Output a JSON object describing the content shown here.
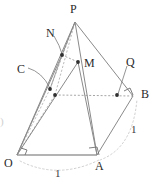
{
  "figure": {
    "kind": "geometry-diagram",
    "width": 159,
    "height": 186,
    "background": "#ffffff",
    "colors": {
      "solid_edge": "#8a8a8a",
      "dashed_edge": "#b0b0b0",
      "dotted_arc": "#c8c8c8",
      "base_edge": "#9a9a9a",
      "point_fill": "#303030",
      "label_text": "#2b2b2b",
      "leader_line": "#7a7a7a"
    },
    "vertices": [
      {
        "id": "P",
        "label": "P",
        "x": 75,
        "y": 22,
        "label_x": 70,
        "label_y": 3,
        "dot": false
      },
      {
        "id": "O",
        "label": "O",
        "x": 17,
        "y": 155,
        "label_x": 4,
        "label_y": 157,
        "dot": false
      },
      {
        "id": "A",
        "label": "A",
        "x": 97,
        "y": 155,
        "label_x": 95,
        "label_y": 160,
        "dot": false
      },
      {
        "id": "B",
        "label": "B",
        "x": 133,
        "y": 96,
        "label_x": 141,
        "label_y": 88,
        "dot": false
      },
      {
        "id": "C",
        "label": "C",
        "x": 50,
        "y": 89,
        "label_x": 17,
        "label_y": 63,
        "dot": true
      },
      {
        "id": "M",
        "label": "M",
        "x": 78,
        "y": 62,
        "label_x": 84,
        "label_y": 57,
        "dot": true
      },
      {
        "id": "N",
        "label": "N",
        "x": 62,
        "y": 55,
        "label_x": 46,
        "label_y": 27,
        "dot": true
      },
      {
        "id": "Q",
        "label": "Q",
        "x": 117,
        "y": 95,
        "label_x": 126,
        "label_y": 56,
        "dot": true
      }
    ],
    "extra_points": [
      {
        "id": "Cx",
        "x": 55,
        "y": 95,
        "dot": true
      }
    ],
    "solid_edges": [
      {
        "from": "O",
        "to": "A",
        "name": "edge-OA"
      },
      {
        "from": "O",
        "to": "P",
        "name": "edge-OP"
      },
      {
        "from": "A",
        "to": "P",
        "name": "edge-AP"
      },
      {
        "from": "P",
        "to": "B",
        "name": "edge-PB"
      },
      {
        "from": "A",
        "to": "B",
        "name": "edge-AB"
      },
      {
        "from": "O",
        "to": "N",
        "name": "edge-ON"
      },
      {
        "from": "N",
        "to": "P",
        "name": "edge-NP"
      },
      {
        "from": "O",
        "to": "M",
        "name": "edge-OM"
      },
      {
        "from": "M",
        "to": "A",
        "name": "edge-MA"
      }
    ],
    "dashed_edges": [
      {
        "from": "O",
        "to": "C",
        "name": "dashed-OC"
      },
      {
        "from": "C",
        "to": "P",
        "name": "dashed-CP"
      },
      {
        "from": "N",
        "to": "M",
        "name": "dashed-NM"
      },
      {
        "from": "Cx",
        "to": "B",
        "name": "dashed-CB"
      },
      {
        "from": "O",
        "to": "Cx",
        "name": "dashed-OCx"
      }
    ],
    "right_angles": [
      {
        "at": "O",
        "name": "right-angle-O"
      },
      {
        "at": "A",
        "name": "right-angle-A"
      },
      {
        "at": "B",
        "name": "right-angle-B"
      }
    ],
    "arcs": [
      {
        "id": "arc-OA",
        "label": "1",
        "label_x": 55,
        "label_y": 168
      },
      {
        "id": "arc-AB",
        "label": "1",
        "label_x": 131,
        "label_y": 124
      }
    ],
    "length_labels": [
      {
        "text": "1",
        "x": 55,
        "y": 168,
        "name": "length-label-OA"
      },
      {
        "text": "1",
        "x": 131,
        "y": 124,
        "name": "length-label-AB"
      }
    ],
    "edge_artifact": {
      "text": ")",
      "x": 0,
      "y": 116
    }
  }
}
